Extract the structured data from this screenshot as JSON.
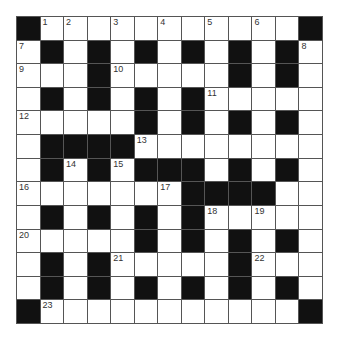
{
  "puzzle": {
    "rows": 13,
    "cols": 13,
    "colors": {
      "black_cell": "#111111",
      "white_cell": "#ffffff",
      "grid_line": "#555555",
      "number_text": "#333333"
    },
    "layout": [
      "#...........#",
      ".#.#.#.#.#.#.",
      "...#.....#.#.",
      ".#.#.#.#.....",
      ".....#.#.#.#.",
      ".####........",
      ".#.#.###.#.#.",
      ".......####..",
      ".#.#.#.#.....",
      ".....#.#.#.#.",
      ".#.#.....#...",
      ".#.#.#.#.#.#.",
      "#...........#"
    ],
    "numbers": [
      {
        "row": 0,
        "col": 1,
        "n": "1"
      },
      {
        "row": 0,
        "col": 2,
        "n": "2"
      },
      {
        "row": 0,
        "col": 4,
        "n": "3"
      },
      {
        "row": 0,
        "col": 6,
        "n": "4"
      },
      {
        "row": 0,
        "col": 8,
        "n": "5"
      },
      {
        "row": 0,
        "col": 10,
        "n": "6"
      },
      {
        "row": 1,
        "col": 0,
        "n": "7"
      },
      {
        "row": 1,
        "col": 12,
        "n": "8"
      },
      {
        "row": 2,
        "col": 0,
        "n": "9"
      },
      {
        "row": 2,
        "col": 4,
        "n": "10"
      },
      {
        "row": 3,
        "col": 8,
        "n": "11"
      },
      {
        "row": 4,
        "col": 0,
        "n": "12"
      },
      {
        "row": 5,
        "col": 5,
        "n": "13"
      },
      {
        "row": 6,
        "col": 2,
        "n": "14"
      },
      {
        "row": 6,
        "col": 4,
        "n": "15"
      },
      {
        "row": 7,
        "col": 0,
        "n": "16"
      },
      {
        "row": 7,
        "col": 6,
        "n": "17"
      },
      {
        "row": 8,
        "col": 8,
        "n": "18"
      },
      {
        "row": 8,
        "col": 10,
        "n": "19"
      },
      {
        "row": 9,
        "col": 0,
        "n": "20"
      },
      {
        "row": 10,
        "col": 4,
        "n": "21"
      },
      {
        "row": 10,
        "col": 10,
        "n": "22"
      },
      {
        "row": 12,
        "col": 1,
        "n": "23"
      }
    ]
  }
}
